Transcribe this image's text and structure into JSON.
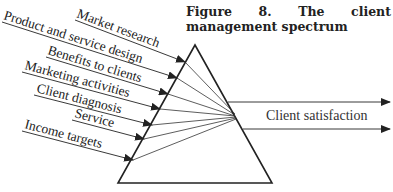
{
  "figure": {
    "title": "Figure 8. The client management spectrum"
  },
  "inputs": [
    {
      "label": "Market research"
    },
    {
      "label": "Product and service design"
    },
    {
      "label": "Benefits to clients"
    },
    {
      "label": "Marketing activities"
    },
    {
      "label": "Client diagnosis"
    },
    {
      "label": "Service"
    },
    {
      "label": "Income targets"
    }
  ],
  "output": {
    "label": "Client satisfaction"
  },
  "colors": {
    "line": "#222222",
    "background": "#ffffff"
  }
}
